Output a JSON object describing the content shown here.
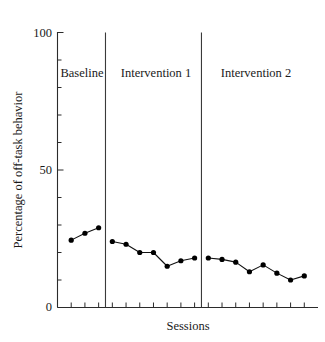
{
  "chart_data": {
    "type": "line",
    "title": "",
    "subtitle": "",
    "xlabel": "Sessions",
    "ylabel": "Percentage of off-task behavior",
    "ylim": [
      0,
      100
    ],
    "ytick_labels": [
      "100",
      "50",
      "0"
    ],
    "ytick_values": [
      100,
      50,
      0
    ],
    "yminor_step": 10,
    "grid": false,
    "legend": "none",
    "x_tick_count": 18,
    "annotations": [
      "Baseline",
      "Intervention 1",
      "Intervention 2"
    ],
    "phases": [
      {
        "name": "Baseline",
        "label": "Baseline",
        "x": [
          1,
          2,
          3
        ],
        "values": [
          24.5,
          27,
          29
        ]
      },
      {
        "name": "Intervention 1",
        "label": "Intervention 1",
        "x": [
          4,
          5,
          6,
          7,
          8,
          9,
          10
        ],
        "values": [
          24,
          23,
          20,
          20,
          15,
          17,
          18
        ]
      },
      {
        "name": "Intervention 2",
        "label": "Intervention 2",
        "x": [
          11,
          12,
          13,
          14,
          15,
          16,
          17,
          18
        ],
        "values": [
          18,
          17.5,
          16.5,
          13,
          15.5,
          12.5,
          10,
          11.5
        ]
      }
    ],
    "series": [
      {
        "name": "Percentage of off-task behavior",
        "values": [
          24.5,
          27,
          29,
          24,
          23,
          20,
          20,
          15,
          17,
          18,
          18,
          17.5,
          16.5,
          13,
          15.5,
          12.5,
          10,
          11.5
        ]
      }
    ],
    "colors": {
      "line": "#111111",
      "marker": "#000000",
      "axis": "#2b2b2b",
      "divider": "#3a3a3a",
      "background": "#ffffff"
    }
  },
  "axis": {
    "y_label": "Percentage of off-task behavior",
    "x_label": "Sessions",
    "y_top_label": "100",
    "y_mid_label": "50",
    "y_zero_label": "0"
  },
  "phase_labels": {
    "baseline": "Baseline",
    "intervention_1": "Intervention 1",
    "intervention_2": "Intervention 2"
  }
}
